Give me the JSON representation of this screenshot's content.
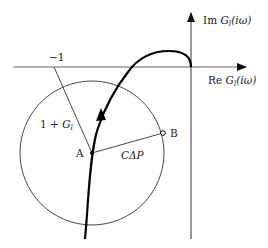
{
  "diagram": {
    "type": "nyquist-plot",
    "axes": {
      "imag_label_prefix": "Im",
      "imag_label_func": "G",
      "imag_label_sub": "l",
      "imag_label_arg": "(iω)",
      "real_label_prefix": "Re",
      "real_label_func": "G",
      "real_label_sub": "l",
      "real_label_arg": "(iω)"
    },
    "critical_point_label": "−1",
    "vector_label_prefix": "1 + ",
    "vector_label_func": "G",
    "vector_label_sub": "l",
    "radius_label": "CΔP",
    "point_a_label": "A",
    "point_b_label": "B"
  }
}
